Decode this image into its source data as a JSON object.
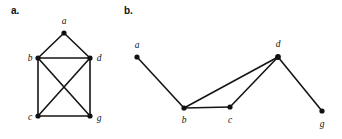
{
  "figure": {
    "width": 342,
    "height": 139,
    "background": "#ffffff",
    "ink_color": "#111111",
    "panels": [
      {
        "id": "panel-a",
        "caption": "a.",
        "caption_pos": {
          "x": 11,
          "y": 6
        },
        "graph": {
          "name": "graph-a",
          "nodes": [
            {
              "id": "a",
              "label": "a",
              "x": 64,
              "y": 33,
              "r": 2.6,
              "label_x": 64,
              "label_y": 24,
              "label_anchor": "middle"
            },
            {
              "id": "b",
              "label": "b",
              "x": 38,
              "y": 58,
              "r": 2.6,
              "label_x": 30,
              "label_y": 61,
              "label_anchor": "middle"
            },
            {
              "id": "d",
              "label": "d",
              "x": 90,
              "y": 58,
              "r": 2.6,
              "label_x": 99,
              "label_y": 61,
              "label_anchor": "middle"
            },
            {
              "id": "c",
              "label": "c",
              "x": 38,
              "y": 116,
              "r": 2.6,
              "label_x": 30,
              "label_y": 120,
              "label_anchor": "middle"
            },
            {
              "id": "g",
              "label": "g",
              "x": 90,
              "y": 116,
              "r": 2.6,
              "label_x": 99,
              "label_y": 121,
              "label_anchor": "middle"
            }
          ],
          "edges": [
            {
              "from": "a",
              "to": "b"
            },
            {
              "from": "a",
              "to": "d"
            },
            {
              "from": "b",
              "to": "d"
            },
            {
              "from": "b",
              "to": "c"
            },
            {
              "from": "b",
              "to": "g"
            },
            {
              "from": "c",
              "to": "d"
            },
            {
              "from": "c",
              "to": "g"
            },
            {
              "from": "d",
              "to": "g"
            }
          ]
        }
      },
      {
        "id": "panel-b",
        "caption": "b.",
        "caption_pos": {
          "x": 124,
          "y": 6
        },
        "graph": {
          "name": "graph-b",
          "nodes": [
            {
              "id": "a",
              "label": "a",
              "x": 137,
              "y": 57,
              "r": 2.6,
              "label_x": 137,
              "label_y": 48,
              "label_anchor": "middle"
            },
            {
              "id": "b",
              "label": "b",
              "x": 184,
              "y": 108,
              "r": 2.6,
              "label_x": 184,
              "label_y": 123,
              "label_anchor": "middle"
            },
            {
              "id": "c",
              "label": "c",
              "x": 230,
              "y": 107,
              "r": 2.6,
              "label_x": 230,
              "label_y": 123,
              "label_anchor": "middle"
            },
            {
              "id": "d",
              "label": "d",
              "x": 278,
              "y": 57,
              "r": 2.9,
              "label_x": 278,
              "label_y": 47,
              "label_anchor": "middle"
            },
            {
              "id": "g",
              "label": "g",
              "x": 322,
              "y": 111,
              "r": 2.6,
              "label_x": 322,
              "label_y": 127,
              "label_anchor": "middle"
            }
          ],
          "edges": [
            {
              "from": "a",
              "to": "b"
            },
            {
              "from": "b",
              "to": "d"
            },
            {
              "from": "b",
              "to": "c"
            },
            {
              "from": "c",
              "to": "d"
            },
            {
              "from": "d",
              "to": "g"
            }
          ]
        }
      }
    ]
  }
}
